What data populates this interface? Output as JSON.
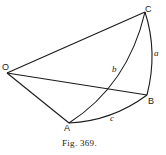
{
  "figure": {
    "caption": "Fig. 369.",
    "points": {
      "O": {
        "label": "O",
        "x": 7,
        "y": 73
      },
      "A": {
        "label": "A",
        "x": 69,
        "y": 123
      },
      "B": {
        "label": "B",
        "x": 147,
        "y": 95
      },
      "C": {
        "label": "C",
        "x": 145,
        "y": 12
      }
    },
    "arc_labels": {
      "a": "a",
      "b": "b",
      "c": "c"
    },
    "line_color": "#1a1a1a"
  }
}
